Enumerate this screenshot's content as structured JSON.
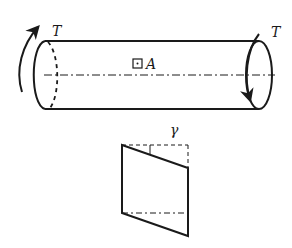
{
  "figure": {
    "labels": {
      "torque_left": "T",
      "torque_right": "T",
      "point": "A",
      "shear_strain": "γ"
    },
    "colors": {
      "stroke": "#1a1a1a",
      "background": "#ffffff"
    }
  }
}
